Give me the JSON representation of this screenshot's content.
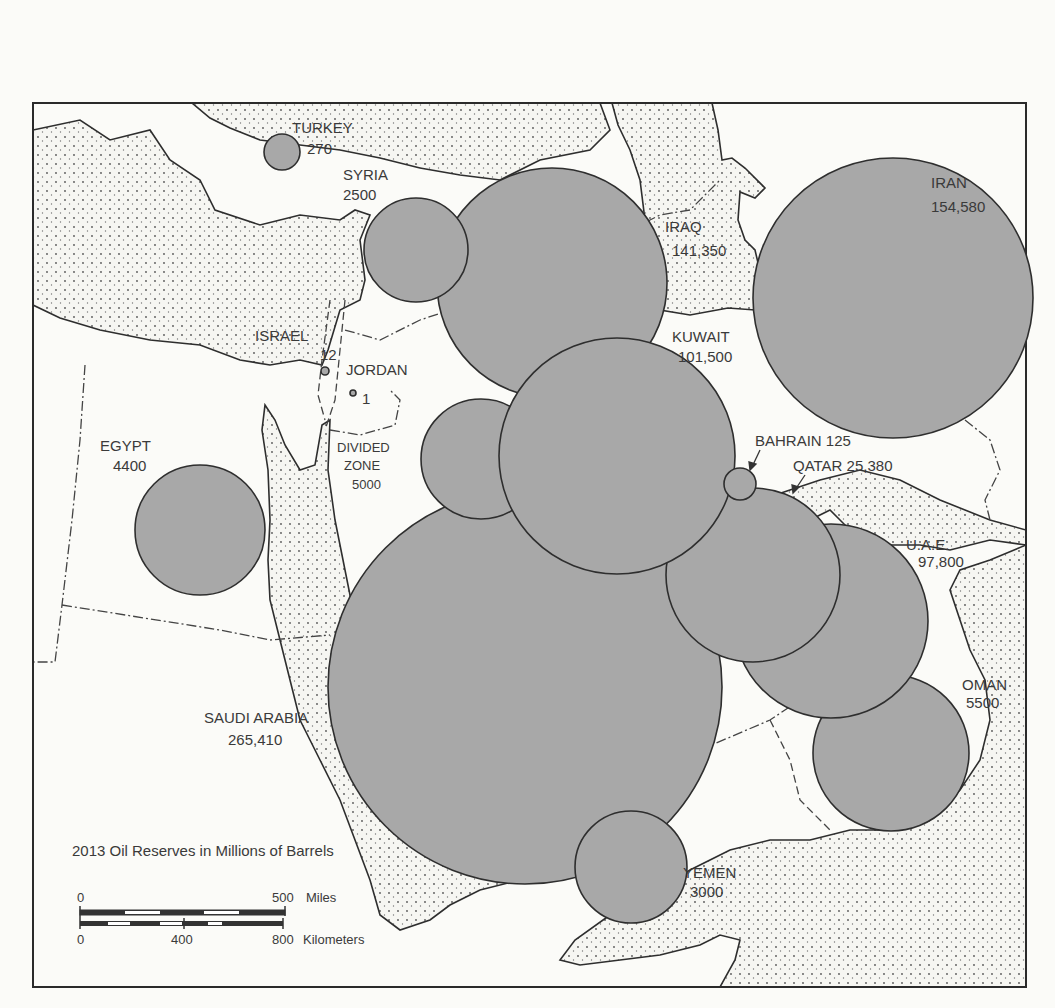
{
  "map": {
    "title": "2013 Oil Reserves in Millions of Barrels",
    "unit": "Millions of Barrels",
    "year": "2013",
    "bubble_color": "#a8a8a8",
    "water_color": "#f4f4f0",
    "countries": [
      {
        "name": "TURKEY",
        "value": "270",
        "cx": 282,
        "cy": 152,
        "r": 18
      },
      {
        "name": "SYRIA",
        "value": "2500",
        "cx": 416,
        "cy": 250,
        "r": 52
      },
      {
        "name": "IRAQ",
        "value": "141,350",
        "cx": 552,
        "cy": 283,
        "r": 115
      },
      {
        "name": "IRAN",
        "value": "154,580",
        "cx": 893,
        "cy": 298,
        "r": 140
      },
      {
        "name": "ISRAEL",
        "value": "12",
        "cx": 325,
        "cy": 371,
        "r": 4
      },
      {
        "name": "JORDAN",
        "value": "1",
        "cx": 353,
        "cy": 393,
        "r": 3
      },
      {
        "name": "KUWAIT",
        "value": "101,500",
        "cx": 617,
        "cy": 456,
        "r": 118
      },
      {
        "name": "DIVIDED ZONE",
        "value": "5000",
        "cx": 481,
        "cy": 459,
        "r": 60
      },
      {
        "name": "EGYPT",
        "value": "4400",
        "cx": 200,
        "cy": 530,
        "r": 65
      },
      {
        "name": "BAHRAIN",
        "value": "125",
        "cx": 740,
        "cy": 484,
        "r": 16
      },
      {
        "name": "QATAR",
        "value": "25,380",
        "cx": 753,
        "cy": 575,
        "r": 87
      },
      {
        "name": "U.A.E.",
        "value": "97,800",
        "cx": 831,
        "cy": 621,
        "r": 97
      },
      {
        "name": "OMAN",
        "value": "5500",
        "cx": 891,
        "cy": 753,
        "r": 78
      },
      {
        "name": "SAUDI ARABIA",
        "value": "265,410",
        "cx": 525,
        "cy": 687,
        "r": 197
      },
      {
        "name": "YEMEN",
        "value": "3000",
        "cx": 631,
        "cy": 867,
        "r": 56
      }
    ],
    "labels": {
      "turkey_name": "TURKEY",
      "turkey_value": "270",
      "syria_name": "SYRIA",
      "syria_value": "2500",
      "iraq_name": "IRAQ",
      "iraq_value": "141,350",
      "iran_name": "IRAN",
      "iran_value": "154,580",
      "israel_name": "ISRAEL",
      "israel_value": "12",
      "jordan_name": "JORDAN",
      "jordan_value": "1",
      "kuwait_name": "KUWAIT",
      "kuwait_value": "101,500",
      "divided_name_1": "DIVIDED",
      "divided_name_2": "ZONE",
      "divided_value": "5000",
      "egypt_name": "EGYPT",
      "egypt_value": "4400",
      "bahrain_label": "BAHRAIN 125",
      "qatar_label": "QATAR 25,380",
      "uae_name": "U.A.E.",
      "uae_value": "97,800",
      "oman_name": "OMAN",
      "oman_value": "5500",
      "saudi_name": "SAUDI ARABIA",
      "saudi_value": "265,410",
      "yemen_name": "YEMEN",
      "yemen_value": "3000"
    },
    "scale_bar": {
      "miles_start": "0",
      "miles_end": "500",
      "miles_unit": "Miles",
      "km_start": "0",
      "km_mid": "400",
      "km_end": "800",
      "km_unit": "Kilometers"
    }
  }
}
